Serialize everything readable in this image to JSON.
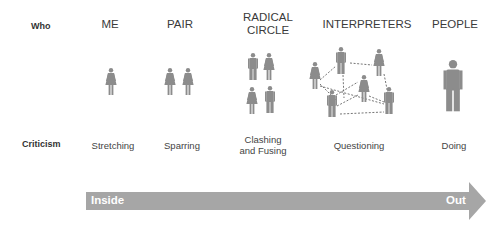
{
  "rows": {
    "who_label": "Who",
    "criticism_label": "Criticism"
  },
  "stages": [
    {
      "who": "ME",
      "criticism": "Stretching",
      "figures": [
        "woman"
      ]
    },
    {
      "who": "PAIR",
      "criticism": "Sparring",
      "figures": [
        "woman",
        "woman"
      ]
    },
    {
      "who_line1": "RADICAL",
      "who_line2": "CIRCLE",
      "criticism_line1": "Clashing",
      "criticism_line2": "and Fusing",
      "figures": [
        "man",
        "woman",
        "woman",
        "man"
      ]
    },
    {
      "who": "INTERPRETERS",
      "criticism": "Questioning",
      "figures": [
        "woman",
        "man",
        "woman",
        "woman",
        "man",
        "man"
      ],
      "connections": "dashed network"
    },
    {
      "who": "PEOPLE",
      "criticism": "Doing",
      "figures": [
        "man-large"
      ]
    }
  ],
  "arrow": {
    "start_label": "Inside",
    "end_label": "Out",
    "color": "#a6a6a6"
  },
  "colors": {
    "figure": "#8c8c8c",
    "dash": "#666666",
    "text": "#333333"
  }
}
